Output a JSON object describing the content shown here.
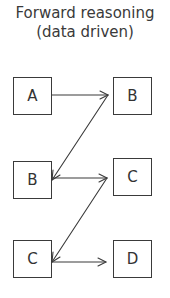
{
  "title": {
    "line1": "Forward reasoning",
    "line2": "(data driven)"
  },
  "nodes": [
    {
      "id": "a-left",
      "label": "A",
      "column": "left",
      "row": 1
    },
    {
      "id": "b-right",
      "label": "B",
      "column": "right",
      "row": 1
    },
    {
      "id": "b-left",
      "label": "B",
      "column": "left",
      "row": 2
    },
    {
      "id": "c-right",
      "label": "C",
      "column": "right",
      "row": 2
    },
    {
      "id": "c-left",
      "label": "C",
      "column": "left",
      "row": 3
    },
    {
      "id": "d-right",
      "label": "D",
      "column": "right",
      "row": 3
    }
  ],
  "edges": [
    {
      "from": "a-left",
      "to": "b-right"
    },
    {
      "from": "b-right",
      "to": "b-left"
    },
    {
      "from": "b-left",
      "to": "c-right"
    },
    {
      "from": "c-right",
      "to": "c-left"
    },
    {
      "from": "c-left",
      "to": "d-right"
    }
  ],
  "colors": {
    "stroke": "#3a3a3a",
    "text": "#333333",
    "background": "#ffffff"
  }
}
